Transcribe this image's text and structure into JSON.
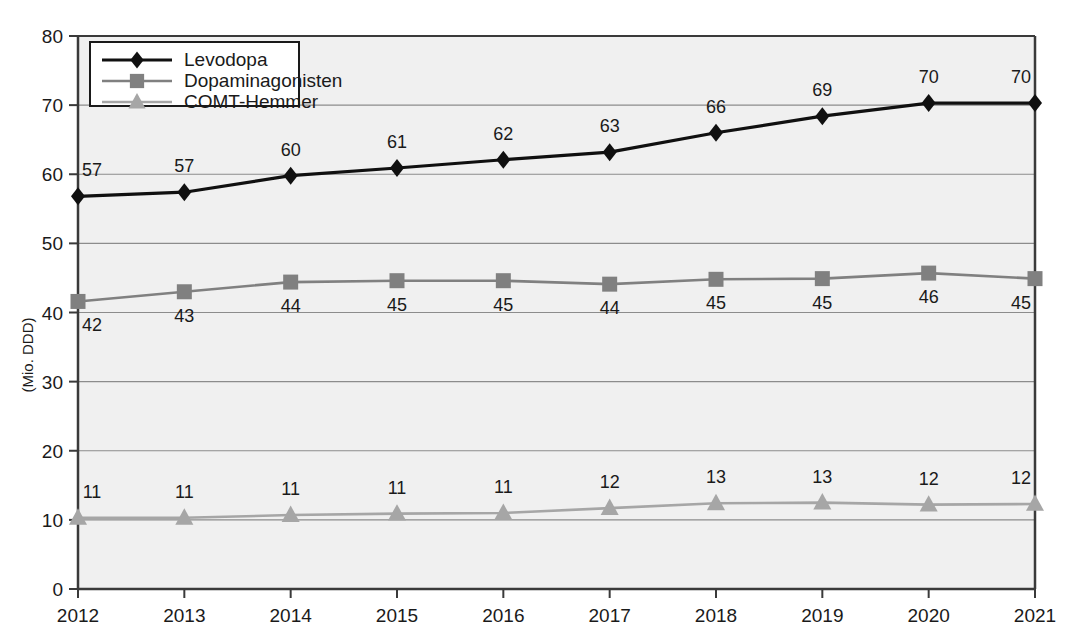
{
  "chart_data": {
    "type": "line",
    "title": "",
    "subtitle": "",
    "xlabel": "",
    "ylabel": "(Mio. DDD)",
    "categories": [
      "2012",
      "2013",
      "2014",
      "2015",
      "2016",
      "2017",
      "2018",
      "2019",
      "2020",
      "2021"
    ],
    "x": [
      2012,
      2013,
      2014,
      2015,
      2016,
      2017,
      2018,
      2019,
      2020,
      2021
    ],
    "ylim": [
      0,
      80
    ],
    "yticks": [
      0,
      10,
      20,
      30,
      40,
      50,
      60,
      70,
      80
    ],
    "ytick_labels": [
      "0",
      "10",
      "20",
      "30",
      "40",
      "50",
      "60",
      "70",
      "80"
    ],
    "grid": true,
    "grid_axis": "y",
    "legend_position": "top-left",
    "plot_background": "#f0f0f0",
    "series": [
      {
        "name": "Levodopa",
        "color": "#101010",
        "marker": "diamond",
        "label_position": "above",
        "values": [
          57,
          57,
          60,
          61,
          62,
          63,
          66,
          69,
          70,
          70
        ],
        "plotted": [
          56.8,
          57.4,
          59.8,
          60.9,
          62.1,
          63.2,
          66.0,
          68.4,
          70.3,
          70.3
        ],
        "value_labels": [
          "57",
          "57",
          "60",
          "61",
          "62",
          "63",
          "66",
          "69",
          "70",
          "70"
        ]
      },
      {
        "name": "Dopaminagonisten",
        "color": "#808080",
        "marker": "square",
        "label_position": "below",
        "values": [
          42,
          43,
          44,
          45,
          45,
          44,
          45,
          45,
          46,
          45
        ],
        "plotted": [
          41.6,
          43.0,
          44.4,
          44.6,
          44.6,
          44.1,
          44.8,
          44.9,
          45.7,
          44.9
        ],
        "value_labels": [
          "42",
          "43",
          "44",
          "45",
          "45",
          "44",
          "45",
          "45",
          "46",
          "45"
        ]
      },
      {
        "name": "COMT-Hemmer",
        "color": "#a6a6a6",
        "marker": "triangle",
        "label_position": "above",
        "values": [
          11,
          11,
          11,
          11,
          11,
          12,
          13,
          13,
          12,
          12
        ],
        "plotted": [
          10.3,
          10.3,
          10.7,
          10.9,
          11.0,
          11.7,
          12.4,
          12.5,
          12.2,
          12.3
        ],
        "value_labels": [
          "11",
          "11",
          "11",
          "11",
          "11",
          "12",
          "13",
          "13",
          "12",
          "12"
        ]
      }
    ]
  },
  "legend": {
    "items": [
      {
        "label": "Levodopa",
        "color": "#101010",
        "marker": "diamond"
      },
      {
        "label": "Dopaminagonisten",
        "color": "#808080",
        "marker": "square"
      },
      {
        "label": "COMT-Hemmer",
        "color": "#a6a6a6",
        "marker": "triangle"
      }
    ]
  },
  "colors": {
    "levodopa": "#101010",
    "dopaminagonisten": "#808080",
    "comt_hemmer": "#a6a6a6",
    "plot_bg": "#f0f0f0",
    "grid": "#8c8c8c",
    "axis": "#3a3a3a",
    "page_bg": "#ffffff",
    "text": "#1a1a1a"
  }
}
